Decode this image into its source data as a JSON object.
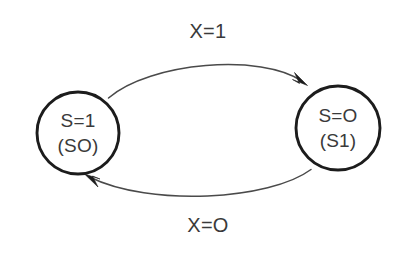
{
  "diagram": {
    "type": "state-transition-diagram",
    "background_color": "#ffffff",
    "node_stroke_color": "#1c1c1c",
    "edge_stroke_color": "#4a4a4a",
    "text_color": "#3a3a3a",
    "states": [
      {
        "id": "left-state",
        "line1": "S=1",
        "line2": "(SO)",
        "cx": 78,
        "cy": 133,
        "r": 41
      },
      {
        "id": "right-state",
        "line1": "S=O",
        "line2": "(S1)",
        "cx": 338,
        "cy": 128,
        "r": 42
      }
    ],
    "transitions": [
      {
        "id": "top-transition",
        "label": "X=1",
        "from": "left-state",
        "to": "right-state",
        "label_x": 208,
        "label_y": 33
      },
      {
        "id": "bottom-transition",
        "label": "X=O",
        "from": "right-state",
        "to": "left-state",
        "label_x": 208,
        "label_y": 227
      }
    ]
  }
}
